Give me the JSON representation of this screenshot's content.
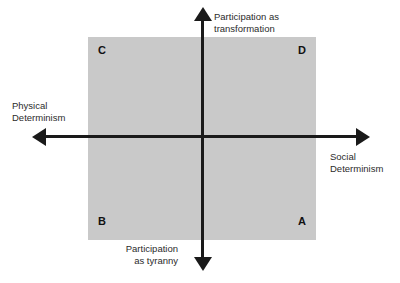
{
  "diagram": {
    "type": "two-axis-quadrant",
    "field_color": "#c9c9c9",
    "axis_color": "#1a1a1a",
    "text_color": "#2b2b2b",
    "background_color": "#ffffff",
    "axes": {
      "vertical": {
        "top_label": "Participation as\ntransformation",
        "bottom_label": "Participation\nas tyranny"
      },
      "horizontal": {
        "left_label": "Physical\nDeterminism",
        "right_label": "Social\nDeterminism"
      }
    },
    "quadrants": [
      {
        "letter": "C",
        "position": "top-left"
      },
      {
        "letter": "D",
        "position": "top-right"
      },
      {
        "letter": "B",
        "position": "bottom-left"
      },
      {
        "letter": "A",
        "position": "bottom-right"
      }
    ]
  }
}
